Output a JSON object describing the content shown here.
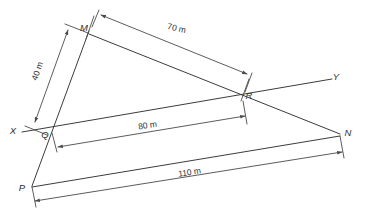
{
  "figure": {
    "points": [
      {
        "id": "X",
        "label": "X",
        "x": 13,
        "y": 134
      },
      {
        "id": "Y",
        "label": "Y",
        "x": 336,
        "y": 80
      },
      {
        "id": "M",
        "label": "M",
        "x": 84,
        "y": 31
      },
      {
        "id": "Q",
        "label": "Q",
        "x": 45,
        "y": 138
      },
      {
        "id": "R",
        "label": "R",
        "x": 246,
        "y": 99
      },
      {
        "id": "N",
        "label": "N",
        "x": 344,
        "y": 136
      },
      {
        "id": "P",
        "label": "P",
        "x": 22,
        "y": 191
      }
    ],
    "dimensions": [
      {
        "id": "qm",
        "label": "40 m",
        "value": 40,
        "unit": "m",
        "from": "Q",
        "to": "M",
        "label_x": 40,
        "label_y": 70,
        "rotation": -70
      },
      {
        "id": "mr",
        "label": "70 m",
        "value": 70,
        "unit": "m",
        "from": "M",
        "to": "R",
        "label_x": 175,
        "label_y": 32,
        "rotation": 13
      },
      {
        "id": "qr",
        "label": "80 m",
        "value": 80,
        "unit": "m",
        "from": "Q",
        "to": "R",
        "label_x": 147,
        "label_y": 130,
        "rotation": -8
      },
      {
        "id": "pn",
        "label": "110 m",
        "value": 110,
        "unit": "m",
        "from": "P",
        "to": "N",
        "label_x": 190,
        "label_y": 178,
        "rotation": -5
      }
    ],
    "lines": [
      {
        "id": "xy",
        "from": "X",
        "to": "Y",
        "through": [
          "Q",
          "R"
        ]
      },
      {
        "id": "mp",
        "from": "M",
        "to": "P",
        "through": [
          "Q"
        ]
      },
      {
        "id": "mn",
        "from": "M",
        "to": "N",
        "through": [
          "R"
        ]
      },
      {
        "id": "pn",
        "from": "P",
        "to": "N"
      }
    ]
  }
}
